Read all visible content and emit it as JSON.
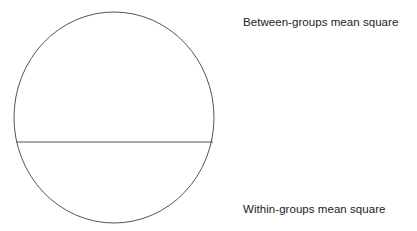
{
  "figure": {
    "name": "variance-partition-circle",
    "background_color": "#ffffff",
    "stroke_color": "#555555",
    "text_color": "#222222"
  },
  "labels": {
    "top": "Between-groups mean square",
    "bottom": "Within-groups mean square"
  },
  "chart_data": {
    "type": "pie",
    "title": "",
    "xlabel": "",
    "ylabel": "",
    "legend_position": "right",
    "grid": false,
    "shape": "circle-split-by-horizontal-chord",
    "categories": [
      "Between-groups mean square",
      "Within-groups mean square"
    ],
    "values": [
      62,
      38
    ],
    "annotations": [
      {
        "text": "Between-groups mean square",
        "position": "top-right"
      },
      {
        "text": "Within-groups mean square",
        "position": "bottom-right"
      }
    ],
    "geometry": {
      "circle_center_x": 114,
      "circle_center_y": 117.5,
      "circle_radius_x": 100,
      "circle_radius_y": 105.5,
      "chord_y": 142,
      "chord_x_start": 16,
      "chord_x_end": 213,
      "stroke_width": 1
    }
  }
}
